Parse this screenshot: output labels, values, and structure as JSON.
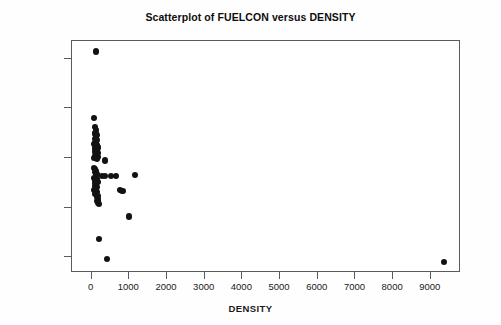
{
  "chart_data": {
    "type": "scatter",
    "title": "Scatterplot of FUELCON versus DENSITY",
    "xlabel": "DENSITY",
    "ylabel": "FUELCON",
    "xlim": [
      -520,
      9800
    ],
    "ylim": [
      268,
      736
    ],
    "xticks": [
      0,
      1000,
      2000,
      3000,
      4000,
      5000,
      6000,
      7000,
      8000,
      9000
    ],
    "xtick_labels": [
      "0",
      "1000",
      "2000",
      "3000",
      "4000",
      "5000",
      "6000",
      "7000",
      "8000",
      "9000"
    ],
    "yticks": [
      300,
      400,
      500,
      600,
      700
    ],
    "ytick_labels": [
      "300",
      "400",
      "500",
      "600",
      "700"
    ],
    "grid": false,
    "legend": false,
    "marker": {
      "shape": "circle",
      "color": "#121212",
      "size_px": 6.2
    },
    "frame_color": "#5a5a5a",
    "background": "#ffffff",
    "points": [
      [
        110,
        715
      ],
      [
        60,
        580
      ],
      [
        95,
        562
      ],
      [
        120,
        556
      ],
      [
        105,
        550
      ],
      [
        80,
        548
      ],
      [
        140,
        546
      ],
      [
        110,
        542
      ],
      [
        90,
        538
      ],
      [
        150,
        536
      ],
      [
        125,
        532
      ],
      [
        100,
        530
      ],
      [
        70,
        528
      ],
      [
        135,
        526
      ],
      [
        115,
        523
      ],
      [
        160,
        521
      ],
      [
        95,
        519
      ],
      [
        145,
        516
      ],
      [
        120,
        514
      ],
      [
        85,
        512
      ],
      [
        155,
        510
      ],
      [
        110,
        508
      ],
      [
        130,
        506
      ],
      [
        100,
        504
      ],
      [
        165,
        502
      ],
      [
        75,
        500
      ],
      [
        140,
        498
      ],
      [
        355,
        495
      ],
      [
        60,
        480
      ],
      [
        95,
        478
      ],
      [
        120,
        474
      ],
      [
        80,
        471
      ],
      [
        145,
        468
      ],
      [
        110,
        466
      ],
      [
        285,
        464
      ],
      [
        360,
        463
      ],
      [
        520,
        464
      ],
      [
        640,
        464
      ],
      [
        1150,
        466
      ],
      [
        70,
        460
      ],
      [
        130,
        458
      ],
      [
        100,
        455
      ],
      [
        160,
        452
      ],
      [
        85,
        449
      ],
      [
        120,
        446
      ],
      [
        95,
        444
      ],
      [
        140,
        441
      ],
      [
        110,
        438
      ],
      [
        75,
        436
      ],
      [
        755,
        435
      ],
      [
        820,
        434
      ],
      [
        150,
        432
      ],
      [
        125,
        430
      ],
      [
        90,
        428
      ],
      [
        165,
        424
      ],
      [
        135,
        421
      ],
      [
        180,
        418
      ],
      [
        155,
        414
      ],
      [
        175,
        410
      ],
      [
        190,
        407
      ],
      [
        1000,
        382
      ],
      [
        200,
        337
      ],
      [
        400,
        297
      ],
      [
        9350,
        290
      ]
    ]
  }
}
